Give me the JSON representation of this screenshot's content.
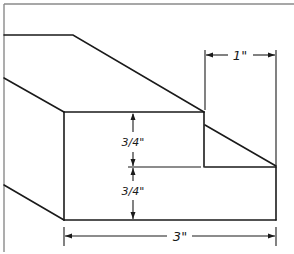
{
  "diagram": {
    "type": "isometric-woodworking-joint",
    "dimensions": {
      "step_width": "1\"",
      "upper_height": "3/4\"",
      "lower_height": "3/4\"",
      "total_width": "3\""
    },
    "colors": {
      "line": "#1a1a1a",
      "frame": "#8a8a8a",
      "background": "#ffffff"
    }
  }
}
